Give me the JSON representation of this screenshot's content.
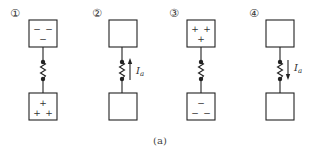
{
  "figure": {
    "caption": "(a)",
    "panels": [
      {
        "label": "①",
        "top_box_charges": [
          "−",
          "−",
          "−"
        ],
        "top_box_layout": "two-top-one-bottom",
        "bottom_box_charges": [
          "+",
          "+",
          "+"
        ],
        "bottom_box_layout": "one-top-two-bottom",
        "current_arrow": null,
        "current_label": null
      },
      {
        "label": "②",
        "top_box_charges": [],
        "bottom_box_charges": [],
        "current_arrow": "up",
        "current_label": "I",
        "current_label_sub": "a"
      },
      {
        "label": "③",
        "top_box_charges": [
          "+",
          "+",
          "+"
        ],
        "top_box_layout": "two-top-one-bottom",
        "bottom_box_charges": [
          "−",
          "−",
          "−"
        ],
        "bottom_box_layout": "one-top-two-bottom",
        "current_arrow": null,
        "current_label": null
      },
      {
        "label": "④",
        "top_box_charges": [],
        "bottom_box_charges": [],
        "current_arrow": "down",
        "current_label": "I",
        "current_label_sub": "a"
      }
    ]
  },
  "colors": {
    "stroke": "#222222",
    "text": "#333333",
    "background": "#ffffff"
  }
}
